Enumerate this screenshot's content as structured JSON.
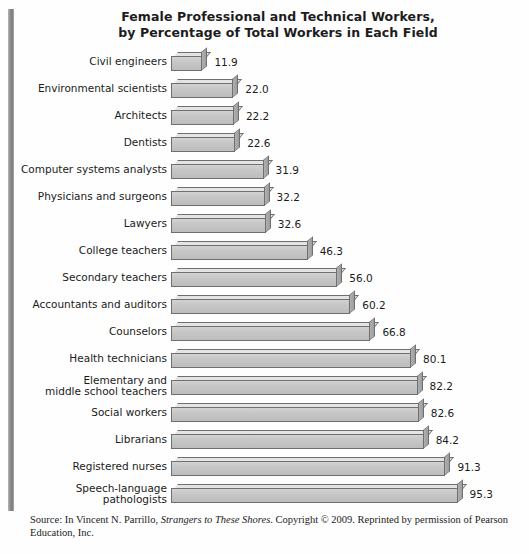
{
  "title": {
    "line1": "Female Professional and Technical Workers,",
    "line2": "by Percentage of Total Workers in Each Field"
  },
  "source": {
    "prefix": "Source: In Vincent N. Parrillo, ",
    "book": "Strangers to These Shores",
    "suffix": ". Copyright © 2009. Reprinted by permission of Pearson Education, Inc."
  },
  "colors": {
    "bar_front": "#c6c6c6",
    "bar_top": "#e4e4e4",
    "bar_cap": "#a5a5a5",
    "bar_outline": "#6f6f6f",
    "text": "#1b1b1b",
    "rule": "#8d8d8d",
    "background": "#ffffff"
  },
  "chart_data": {
    "type": "bar",
    "orientation": "horizontal",
    "title": "Female Professional and Technical Workers, by Percentage of Total Workers in Each Field",
    "xlabel": "",
    "ylabel": "",
    "xlim": [
      0,
      100
    ],
    "grid": false,
    "legend": false,
    "value_labels": true,
    "categories": [
      "Civil engineers",
      "Environmental scientists",
      "Architects",
      "Dentists",
      "Computer systems analysts",
      "Physicians and surgeons",
      "Lawyers",
      "College teachers",
      "Secondary teachers",
      "Accountants and auditors",
      "Counselors",
      "Health technicians",
      "Elementary and\nmiddle school teachers",
      "Social workers",
      "Librarians",
      "Registered nurses",
      "Speech-language pathologists"
    ],
    "values": [
      11.9,
      22.0,
      22.2,
      22.6,
      31.9,
      32.2,
      32.6,
      46.3,
      56.0,
      60.2,
      66.8,
      80.1,
      82.2,
      82.6,
      84.2,
      91.3,
      95.3
    ],
    "value_text": [
      "11.9",
      "22.0",
      "22.2",
      "22.6",
      "31.9",
      "32.2",
      "32.6",
      "46.3",
      "56.0",
      "60.2",
      "66.8",
      "80.1",
      "82.2",
      "82.6",
      "84.2",
      "91.3",
      "95.3"
    ]
  }
}
